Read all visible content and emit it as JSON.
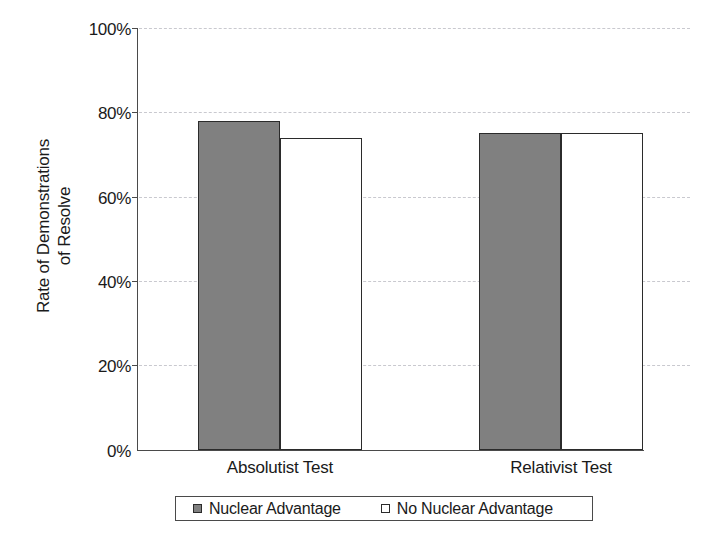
{
  "chart_data": {
    "type": "bar",
    "title": "",
    "subtitle": "",
    "xlabel": "",
    "ylabel": "Rate of Demonstrations\nof Resolve",
    "categories": [
      "Absolutist Test",
      "Relativist Test"
    ],
    "series": [
      {
        "name": "Nuclear Advantage",
        "values": [
          78,
          75
        ],
        "color": "#808080",
        "fill": "solid"
      },
      {
        "name": "No Nuclear Advantage",
        "values": [
          74,
          75
        ],
        "color": "#ffffff",
        "fill": "hollow"
      }
    ],
    "ylim": [
      0,
      100
    ],
    "ytick_values": [
      0,
      20,
      40,
      60,
      80,
      100
    ],
    "ytick_labels": [
      "0%",
      "20%",
      "40%",
      "60%",
      "80%",
      "100%"
    ],
    "grid": true,
    "grid_style": "dashed-horizontal",
    "grid_color": "#c9c9cf",
    "legend_position": "bottom",
    "value_format": "percent",
    "axis_color": "#4a4a4a",
    "bar_outline_color": "#2b2b2b",
    "background": "#ffffff"
  },
  "legend": {
    "entries": [
      {
        "label": "Nuclear Advantage",
        "swatch": "filled-gray-square"
      },
      {
        "label": "No Nuclear Advantage",
        "swatch": "hollow-white-square"
      }
    ]
  }
}
